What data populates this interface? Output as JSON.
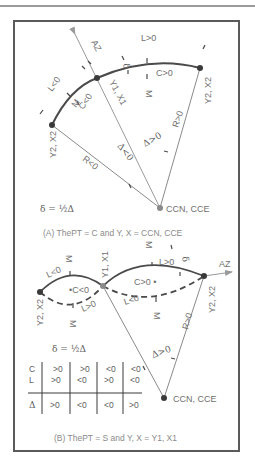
{
  "figure": {
    "panel_a": {
      "caption": "(A) ThePT = C and Y, X = CCN, CCE",
      "formula": "δ = ½Δ",
      "labels": {
        "az": "AZ",
        "l_pos": "L>0",
        "l_neg": "L<0",
        "c_pos": "C>0",
        "c_neg": "C<0",
        "m1": "M",
        "m2": "M",
        "delta_small": "δ",
        "pt1": "Y1, X1",
        "pt2_right": "Y2, X2",
        "pt2_left": "Y2, X2",
        "r_pos": "R>0",
        "r_neg": "R<0",
        "d_pos": "Δ>0",
        "d_neg": "Δ<0",
        "center": "CCN, CCE"
      }
    },
    "panel_b": {
      "caption": "(B) ThePT = S and Y, X = Y1, X1",
      "formula": "δ = ½Δ",
      "labels": {
        "az": "AZ",
        "l_neg_top": "L<0",
        "l_pos_top": "L>0",
        "l_pos_bottom": "L>0",
        "l_neg_bottom": "L<0",
        "c_neg": "•C<0",
        "c_pos": "C>0 •",
        "m_top_left": "M",
        "m_top_right": "M",
        "m_bottom_left": "M",
        "m_bottom_right": "M",
        "delta_small": "δ",
        "pt1": "Y1, X1",
        "pt2_left": "Y2, X2",
        "pt2_right": "Y2, X2",
        "r_pos": "R>0",
        "d_pos": "Δ>0",
        "center": "CCN, CCE"
      },
      "table": {
        "row_labels": [
          "C",
          "L",
          "Δ"
        ],
        "rows": [
          [
            ">0",
            ">0",
            "<0",
            "<0"
          ],
          [
            ">0",
            "<0",
            ">0",
            "<0"
          ],
          [
            ">0",
            "<0",
            "<0",
            ">0"
          ]
        ]
      }
    },
    "colors": {
      "curve": "#4a4a4a",
      "line": "#8a8a8a",
      "text": "#707070",
      "frame": "#5a5a5a"
    }
  }
}
